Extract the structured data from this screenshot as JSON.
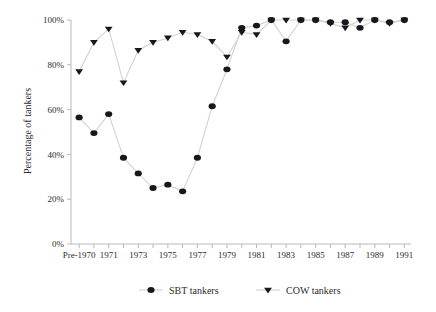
{
  "chart_data": {
    "type": "line",
    "title": "",
    "xlabel": "",
    "ylabel": "Percentage of tankers",
    "ylim": [
      0,
      100
    ],
    "ytick_labels": [
      "0%",
      "20%",
      "40%",
      "60%",
      "80%",
      "100%"
    ],
    "ytick_values": [
      0,
      20,
      40,
      60,
      80,
      100
    ],
    "grid": false,
    "legend_position": "bottom",
    "x": [
      "Pre-1970",
      "1970",
      "1971",
      "1972",
      "1973",
      "1974",
      "1975",
      "1976",
      "1977",
      "1978",
      "1979",
      "1980",
      "1981",
      "1982",
      "1983",
      "1984",
      "1985",
      "1986",
      "1987",
      "1988",
      "1989",
      "1990",
      "1991"
    ],
    "xtick_labels": [
      "Pre-1970",
      "",
      "1971",
      "",
      "1973",
      "",
      "1975",
      "",
      "1977",
      "",
      "1979",
      "",
      "1981",
      "",
      "1983",
      "",
      "1985",
      "",
      "1987",
      "",
      "1989",
      "",
      "1991"
    ],
    "series": [
      {
        "name": "SBT tankers",
        "marker": "circle",
        "color": "#17171d",
        "values": [
          56.5,
          49.5,
          58,
          38.5,
          31.5,
          25,
          26.5,
          23.5,
          38.5,
          61.5,
          78,
          96.5,
          97.5,
          100,
          90.5,
          100,
          100,
          99,
          99,
          96.5,
          100,
          99,
          100
        ]
      },
      {
        "name": "COW tankers",
        "marker": "triangle-down",
        "color": "#17171d",
        "values": [
          77,
          90,
          96,
          72,
          86.5,
          90,
          92,
          94.5,
          93.5,
          90.5,
          83.5,
          94.5,
          93.5,
          100,
          100,
          100,
          100,
          98.5,
          96.5,
          100,
          100,
          98.5,
          100
        ]
      }
    ]
  },
  "legend": {
    "items": [
      {
        "label": "SBT tankers",
        "marker": "circle"
      },
      {
        "label": "COW tankers",
        "marker": "triangle-down"
      }
    ]
  }
}
